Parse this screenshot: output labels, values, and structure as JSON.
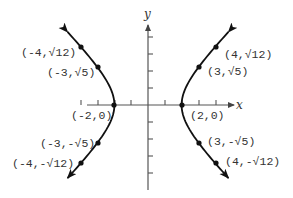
{
  "figure": {
    "type": "hyperbola-graph",
    "equation_implied": "x^2 - y^2 = 4",
    "axes": {
      "x_label": "x",
      "y_label": "y",
      "x_ticks": [
        -4,
        -3,
        -2,
        -1,
        1,
        2,
        3,
        4
      ],
      "y_ticks": [
        -4,
        -3,
        -2,
        -1,
        1,
        2,
        3,
        4
      ]
    },
    "points": [
      {
        "id": "p-neg4-pos",
        "x": -4,
        "y": 3.4641,
        "label": "(-4,√12)"
      },
      {
        "id": "p-neg3-pos",
        "x": -3,
        "y": 2.2361,
        "label": "(-3,√5)"
      },
      {
        "id": "p-neg2-0",
        "x": -2,
        "y": 0,
        "label": "(-2,0)"
      },
      {
        "id": "p-neg3-neg",
        "x": -3,
        "y": -2.2361,
        "label": "(-3,-√5)"
      },
      {
        "id": "p-neg4-neg",
        "x": -4,
        "y": -3.4641,
        "label": "(-4,-√12)"
      },
      {
        "id": "p-pos4-pos",
        "x": 4,
        "y": 3.4641,
        "label": "(4,√12)"
      },
      {
        "id": "p-pos3-pos",
        "x": 3,
        "y": 2.2361,
        "label": "(3,√5)"
      },
      {
        "id": "p-pos2-0",
        "x": 2,
        "y": 0,
        "label": "(2,0)"
      },
      {
        "id": "p-pos3-neg",
        "x": 3,
        "y": -2.2361,
        "label": "(3,-√5)"
      },
      {
        "id": "p-pos4-neg",
        "x": 4,
        "y": -3.4641,
        "label": "(4,-√12)"
      }
    ],
    "colors": {
      "curve": "#111111",
      "axes": "#555555",
      "text": "#333333",
      "background": "#ffffff"
    }
  }
}
